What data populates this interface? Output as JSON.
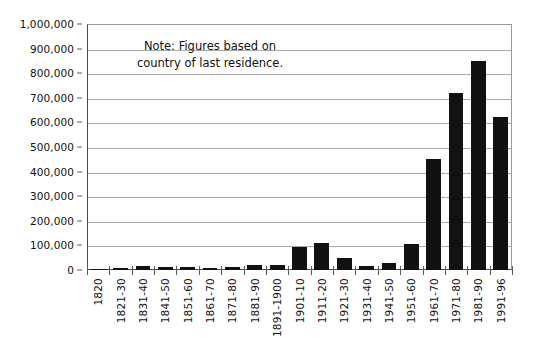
{
  "chart_data": {
    "type": "bar",
    "title": "",
    "subtitle": "",
    "xlabel": "",
    "ylabel": "",
    "ylim": [
      0,
      1000000
    ],
    "grid": true,
    "legend": false,
    "legend_position": "none",
    "orientation": "vertical",
    "bar_color": "#111111",
    "categories": [
      "1820",
      "1821-30",
      "1831-40",
      "1841-50",
      "1851-60",
      "1861-70",
      "1871-80",
      "1881-90",
      "1891-1900",
      "1901-10",
      "1911-20",
      "1921-30",
      "1931-40",
      "1941-50",
      "1951-60",
      "1961-70",
      "1971-80",
      "1981-90",
      "1991-96"
    ],
    "values": [
      1000,
      8000,
      15000,
      13000,
      11000,
      10000,
      12000,
      22000,
      22000,
      95000,
      110000,
      50000,
      15000,
      30000,
      105000,
      450000,
      720000,
      850000,
      620000
    ],
    "y_ticks": [
      0,
      100000,
      200000,
      300000,
      400000,
      500000,
      600000,
      700000,
      800000,
      900000,
      1000000
    ],
    "y_tick_labels": [
      "0",
      "100,000",
      "200,000",
      "300,000",
      "400,000",
      "500,000",
      "600,000",
      "700,000",
      "800,000",
      "900,000",
      "1,000,000"
    ],
    "annotations": [
      {
        "name": "note",
        "lines": [
          "Note: Figures based on",
          "country of last residence."
        ]
      }
    ]
  },
  "note": {
    "line1": "Note: Figures based on",
    "line2": "country of last residence."
  }
}
